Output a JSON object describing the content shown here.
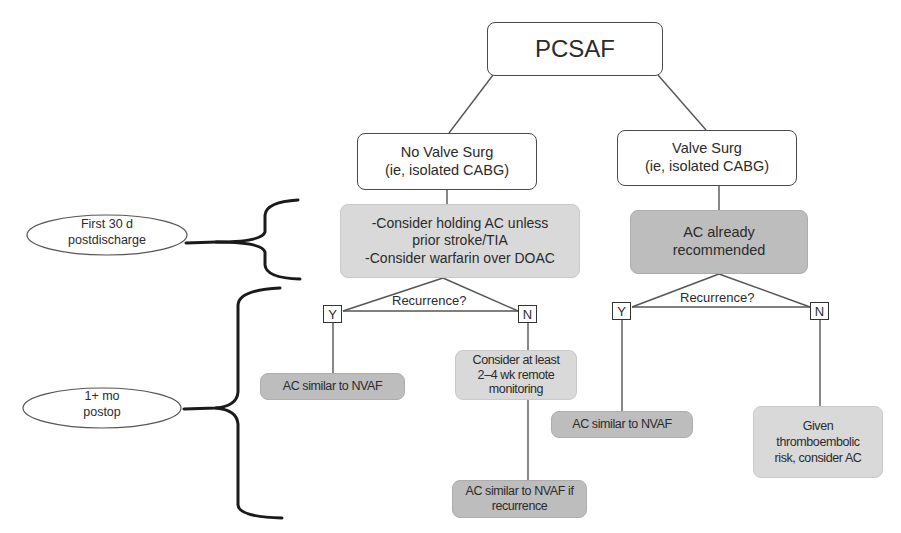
{
  "diagram": {
    "root": {
      "label": "PCSAF"
    },
    "branches": [
      {
        "id": "no-valve",
        "title_line1": "No Valve Surg",
        "title_line2": "(ie, isolated CABG)",
        "initial_action": {
          "line1": "-Consider holding AC unless",
          "line2": "prior stroke/TIA",
          "line3": "-Consider warfarin over DOAC"
        },
        "decision": "Recurrence?",
        "yes_label": "Y",
        "no_label": "N",
        "yes_outcome": "AC similar to NVAF",
        "no_outcome": {
          "line1": "Consider at least",
          "line2": "2–4 wk remote",
          "line3": "monitoring"
        },
        "no_followup": {
          "line1": "AC similar to NVAF if",
          "line2": "recurrence"
        }
      },
      {
        "id": "valve",
        "title_line1": "Valve Surg",
        "title_line2": "(ie, isolated CABG)",
        "initial_action": {
          "line1": "AC already",
          "line2": "recommended"
        },
        "decision": "Recurrence?",
        "yes_label": "Y",
        "no_label": "N",
        "yes_outcome": "AC similar to NVAF",
        "no_outcome": {
          "line1": "Given",
          "line2": "thromboembolic",
          "line3": "risk, consider AC"
        }
      }
    ],
    "time_periods": [
      {
        "line1": "First 30 d",
        "line2": "postdischarge"
      },
      {
        "line1": "1+ mo",
        "line2": "postop"
      }
    ],
    "colors": {
      "line": "#4a4a4a",
      "brace": "#1a1a1a",
      "light_fill": "#d9d9d9",
      "dark_fill": "#bdbdbd",
      "white_fill": "#ffffff"
    }
  }
}
